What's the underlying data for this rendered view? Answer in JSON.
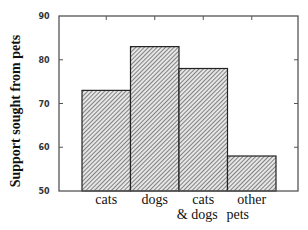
{
  "chart_data": {
    "type": "bar",
    "title": "",
    "xlabel": "",
    "ylabel": "Support sought from pets",
    "categories": [
      {
        "lines": [
          "cats"
        ]
      },
      {
        "lines": [
          "dogs"
        ]
      },
      {
        "lines": [
          "cats",
          "& dogs"
        ]
      },
      {
        "lines": [
          "other",
          "pets"
        ]
      }
    ],
    "category_names": [
      "cats",
      "dogs",
      "cats & dogs",
      "other pets"
    ],
    "values": [
      73,
      83,
      78,
      58
    ],
    "ylim": [
      50,
      90
    ],
    "yticks": [
      50,
      60,
      70,
      80,
      90
    ],
    "grid": false,
    "legend": null,
    "bar_fill": "diagonal-hatch",
    "colors": {
      "bar_stroke": "#222222",
      "hatch": "#555555",
      "axis": "#555555"
    }
  }
}
